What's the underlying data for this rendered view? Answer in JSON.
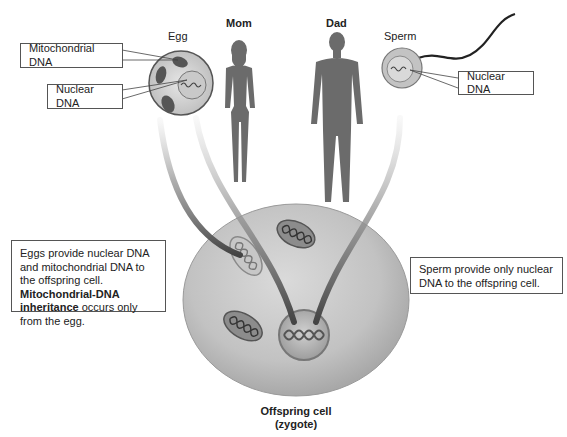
{
  "labels": {
    "egg": "Egg",
    "mom": "Mom",
    "dad": "Dad",
    "sperm": "Sperm"
  },
  "callouts": {
    "egg_mito": "Mitochondrial DNA",
    "egg_nuclear": "Nuclear DNA",
    "sperm_nuclear": "Nuclear DNA"
  },
  "notes": {
    "egg": {
      "plain1": "Eggs provide nuclear DNA and mitochondrial DNA to the offspring cell. ",
      "bold": "Mitochondrial-DNA inheritance",
      "plain2": " occurs only from the egg."
    },
    "sperm": "Sperm provide only nuclear DNA to the offspring cell."
  },
  "zygote": {
    "title": "Offspring cell",
    "subtitle": "(zygote)"
  },
  "colors": {
    "silhouette": "#6b6b6b",
    "cell_fill": "#c4c4c4",
    "cell_edge": "#8a8a8a",
    "arrow_dark": "#4a4a4a",
    "mito": "#5a5a5a"
  }
}
